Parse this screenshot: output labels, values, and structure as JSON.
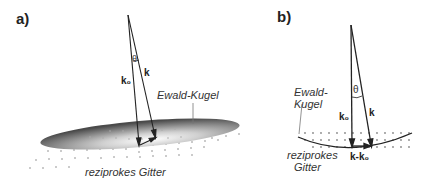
{
  "panel_a": {
    "tag": "a)",
    "sphere_label": "Ewald-Kugel",
    "lattice_label": "reziprokes Gitter",
    "angle_symbol": "θ",
    "vector_k0": "k₀",
    "vector_k": "k"
  },
  "panel_b": {
    "tag": "b)",
    "sphere_label_line1": "Ewald-",
    "sphere_label_line2": "Kugel",
    "lattice_label_line1": "reziprokes",
    "lattice_label_line2": "Gitter",
    "angle_symbol": "θ",
    "vector_k0": "k₀",
    "vector_k": "k",
    "difference_label": "k-k₀"
  },
  "colors": {
    "line": "#222222",
    "dots": "#777777",
    "disk_dark": "#555555",
    "disk_light": "#f2f2f2"
  }
}
